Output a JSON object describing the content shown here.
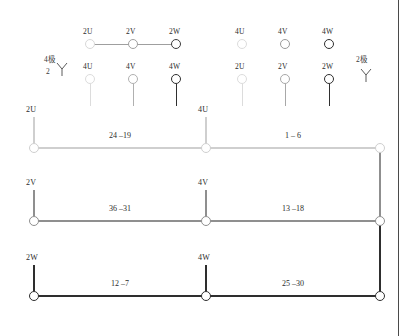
{
  "diagram": {
    "poles": {
      "left": {
        "text": "4极",
        "sub": "2",
        "symbol": "Y"
      },
      "right": {
        "text": "2极",
        "symbol": "Y"
      }
    },
    "top_groups": [
      {
        "name": "left-top-row",
        "connected": true,
        "terminals": [
          {
            "label": "2U",
            "shade": "#d8d8d8"
          },
          {
            "label": "2V",
            "shade": "#a0a0a0"
          },
          {
            "label": "2W",
            "shade": "#3d3d3d"
          }
        ]
      },
      {
        "name": "right-top-row",
        "connected": false,
        "terminals": [
          {
            "label": "4U",
            "shade": "#dcdcdc"
          },
          {
            "label": "4V",
            "shade": "#9a9a9a"
          },
          {
            "label": "4W",
            "shade": "#2f2f2f"
          }
        ]
      },
      {
        "name": "left-second-row",
        "connected": false,
        "terminals": [
          {
            "label": "4U",
            "shade": "#dcdcdc"
          },
          {
            "label": "4V",
            "shade": "#b0b0b0"
          },
          {
            "label": "4W",
            "shade": "#2f2f2f"
          }
        ]
      },
      {
        "name": "right-second-row",
        "connected": false,
        "terminals": [
          {
            "label": "2U",
            "shade": "#dcdcdc"
          },
          {
            "label": "2V",
            "shade": "#a8a8a8"
          },
          {
            "label": "2W",
            "shade": "#2f2f2f"
          }
        ]
      }
    ],
    "rows": [
      {
        "name": "row-1",
        "left_label": "2U",
        "mid_label": "4U",
        "left_segment": "24 –19",
        "right_segment": "1 – 6",
        "shade": "#cfcfcf"
      },
      {
        "name": "row-2",
        "left_label": "2V",
        "mid_label": "4V",
        "left_segment": "36 –31",
        "right_segment": "13 –18",
        "shade": "#8f8f8f"
      },
      {
        "name": "row-3",
        "left_label": "2W",
        "mid_label": "4W",
        "left_segment": "12 –7",
        "right_segment": "25 –30",
        "shade": "#2e2e2e"
      }
    ]
  }
}
